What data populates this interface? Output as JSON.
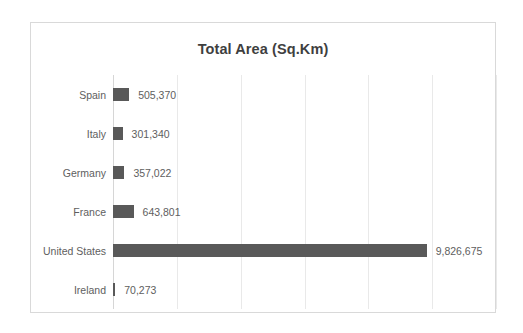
{
  "chart_data": {
    "type": "bar",
    "orientation": "horizontal",
    "title": "Total Area (Sq.Km)",
    "xlabel": "",
    "ylabel": "",
    "categories": [
      "Spain",
      "Italy",
      "Germany",
      "France",
      "United States",
      "Ireland"
    ],
    "values": [
      505370,
      301340,
      357022,
      643801,
      9826675,
      70273
    ],
    "value_labels": [
      "505,370",
      "301,340",
      "357,022",
      "643,801",
      "9,826,675",
      "70,273"
    ],
    "xlim": [
      0,
      12000000
    ],
    "xticks": [
      0,
      2000000,
      4000000,
      6000000,
      8000000,
      10000000,
      12000000
    ],
    "xtick_labels": [],
    "grid": true,
    "legend": false,
    "bar_color": "#595959",
    "gridline_color": "#e9e9e9",
    "axis_color": "#d6d6d6",
    "text_color": "#5e5e5e",
    "border_color": "#d9d9d9",
    "background": "#ffffff",
    "series": [
      {
        "name": "Total Area (Sq.Km)",
        "values": [
          505370,
          301340,
          357022,
          643801,
          9826675,
          70273
        ]
      }
    ]
  }
}
